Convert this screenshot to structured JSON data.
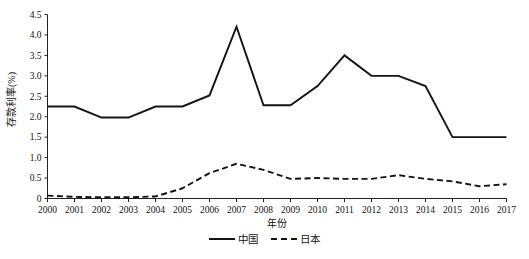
{
  "chart_data": {
    "type": "line",
    "title": "",
    "xlabel": "年份",
    "ylabel": "存款利率(%)",
    "categories": [
      "2000",
      "2001",
      "2002",
      "2003",
      "2004",
      "2005",
      "2006",
      "2007",
      "2008",
      "2009",
      "2010",
      "2011",
      "2012",
      "2013",
      "2014",
      "2015",
      "2016",
      "2017"
    ],
    "x": [
      2000,
      2001,
      2002,
      2003,
      2004,
      2005,
      2006,
      2007,
      2008,
      2009,
      2010,
      2011,
      2012,
      2013,
      2014,
      2015,
      2016,
      2017
    ],
    "ylim": [
      0,
      4.5
    ],
    "xlim": [
      2000,
      2017
    ],
    "yticks": [
      "0",
      "0.5",
      "1.0",
      "1.5",
      "2.0",
      "2.5",
      "3.0",
      "3.5",
      "4.0",
      "4.5"
    ],
    "ytick_values": [
      0,
      0.5,
      1.0,
      1.5,
      2.0,
      2.5,
      3.0,
      3.5,
      4.0,
      4.5
    ],
    "grid": false,
    "legend_position": "bottom-center",
    "series": [
      {
        "name": "中国",
        "style": "solid",
        "color": "#141414",
        "values": [
          2.25,
          2.25,
          1.98,
          1.98,
          2.25,
          2.25,
          2.52,
          4.2,
          2.28,
          2.28,
          2.75,
          3.5,
          3.0,
          3.0,
          2.75,
          1.5,
          1.5,
          1.5
        ]
      },
      {
        "name": "日本",
        "style": "dashed",
        "color": "#141414",
        "values": [
          0.07,
          0.04,
          0.03,
          0.03,
          0.05,
          0.25,
          0.62,
          0.85,
          0.7,
          0.48,
          0.5,
          0.48,
          0.48,
          0.57,
          0.48,
          0.42,
          0.3,
          0.35
        ]
      }
    ]
  },
  "legend": {
    "entries": [
      {
        "label": "中国",
        "style": "solid"
      },
      {
        "label": "日本",
        "style": "dashed"
      }
    ]
  },
  "caption": {
    "text": ""
  }
}
